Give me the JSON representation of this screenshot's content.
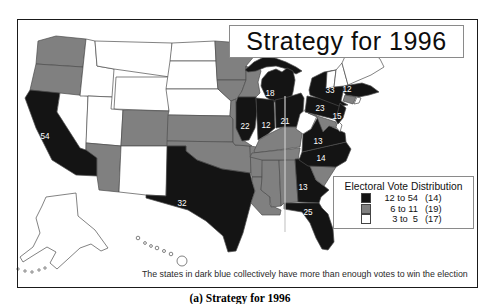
{
  "title": "Strategy for 1996",
  "legend": {
    "title": "Electoral Vote Distribution",
    "entries": [
      {
        "range": "12 to 54",
        "count": "(14)",
        "category": "dark"
      },
      {
        "range": "6 to 11",
        "count": "(19)",
        "category": "medium"
      },
      {
        "range": "3 to  5",
        "count": "(17)",
        "category": "light"
      }
    ]
  },
  "footnote": "The states in dark blue collectively have more than enough votes to win the election",
  "caption": "(a) Strategy for 1996",
  "colors": {
    "dark": "#141414",
    "medium": "#808080",
    "light": "#ffffff",
    "outline": "#4d4d4d",
    "label_text": "#ffffff",
    "artifact_line": "#c9c9c9"
  },
  "map": {
    "states": [
      {
        "id": "WA",
        "category": "medium"
      },
      {
        "id": "OR",
        "category": "medium"
      },
      {
        "id": "CA",
        "category": "dark",
        "label": "54"
      },
      {
        "id": "NV",
        "category": "light"
      },
      {
        "id": "ID",
        "category": "light"
      },
      {
        "id": "MT",
        "category": "light"
      },
      {
        "id": "WY",
        "category": "light"
      },
      {
        "id": "UT",
        "category": "light"
      },
      {
        "id": "CO",
        "category": "medium"
      },
      {
        "id": "AZ",
        "category": "medium"
      },
      {
        "id": "NM",
        "category": "light"
      },
      {
        "id": "ND",
        "category": "light"
      },
      {
        "id": "SD",
        "category": "light"
      },
      {
        "id": "NE",
        "category": "light"
      },
      {
        "id": "KS",
        "category": "medium"
      },
      {
        "id": "OK",
        "category": "medium"
      },
      {
        "id": "TX",
        "category": "dark",
        "label": "32"
      },
      {
        "id": "MN",
        "category": "medium"
      },
      {
        "id": "IA",
        "category": "medium"
      },
      {
        "id": "MO",
        "category": "medium"
      },
      {
        "id": "AR",
        "category": "medium"
      },
      {
        "id": "LA",
        "category": "medium"
      },
      {
        "id": "MS",
        "category": "medium"
      },
      {
        "id": "AL",
        "category": "medium"
      },
      {
        "id": "WI",
        "category": "medium"
      },
      {
        "id": "MIUP",
        "category": "dark"
      },
      {
        "id": "MI",
        "category": "dark",
        "label": "18"
      },
      {
        "id": "IL",
        "category": "dark",
        "label": "22"
      },
      {
        "id": "IN",
        "category": "dark",
        "label": "12"
      },
      {
        "id": "OH",
        "category": "dark",
        "label": "21"
      },
      {
        "id": "KY",
        "category": "medium"
      },
      {
        "id": "TN",
        "category": "medium"
      },
      {
        "id": "GA",
        "category": "dark",
        "label": "13"
      },
      {
        "id": "FL",
        "category": "dark",
        "label": "25"
      },
      {
        "id": "SC",
        "category": "medium"
      },
      {
        "id": "NC",
        "category": "dark",
        "label": "14"
      },
      {
        "id": "VA",
        "category": "dark",
        "label": "13"
      },
      {
        "id": "WV",
        "category": "light"
      },
      {
        "id": "PA",
        "category": "dark",
        "label": "23"
      },
      {
        "id": "NY",
        "category": "dark",
        "label": "33"
      },
      {
        "id": "MD",
        "category": "medium"
      },
      {
        "id": "DE",
        "category": "light"
      },
      {
        "id": "NJ",
        "category": "dark",
        "label": "15"
      },
      {
        "id": "CT",
        "category": "medium"
      },
      {
        "id": "RI",
        "category": "light"
      },
      {
        "id": "MA",
        "category": "dark",
        "label": "12"
      },
      {
        "id": "VT",
        "category": "light"
      },
      {
        "id": "NH",
        "category": "light"
      },
      {
        "id": "ME",
        "category": "light"
      },
      {
        "id": "AK",
        "category": "light"
      },
      {
        "id": "HI",
        "category": "light"
      }
    ]
  }
}
